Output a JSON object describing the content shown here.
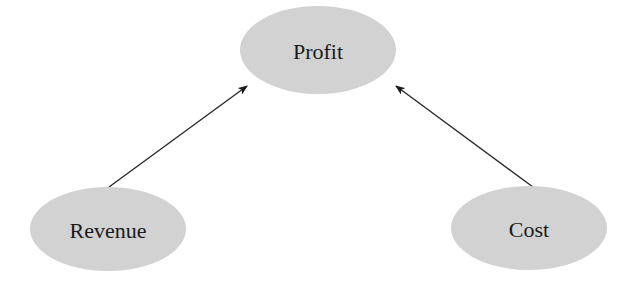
{
  "diagram": {
    "type": "directed-graph",
    "nodes": [
      {
        "id": "profit",
        "label": "Profit",
        "cx": 318,
        "cy": 50,
        "rx": 78,
        "ry": 44
      },
      {
        "id": "revenue",
        "label": "Revenue",
        "cx": 108,
        "cy": 229,
        "rx": 78,
        "ry": 42
      },
      {
        "id": "cost",
        "label": "Cost",
        "cx": 529,
        "cy": 228,
        "rx": 78,
        "ry": 42
      }
    ],
    "edges": [
      {
        "from": "revenue",
        "to": "profit",
        "x1": 109,
        "y1": 187,
        "x2": 247,
        "y2": 86
      },
      {
        "from": "cost",
        "to": "profit",
        "x1": 533,
        "y1": 187,
        "x2": 396,
        "y2": 86
      }
    ],
    "colors": {
      "node_fill": "#d2d2d2",
      "edge": "#2a2a2a",
      "text": "#1a1a1a"
    }
  }
}
